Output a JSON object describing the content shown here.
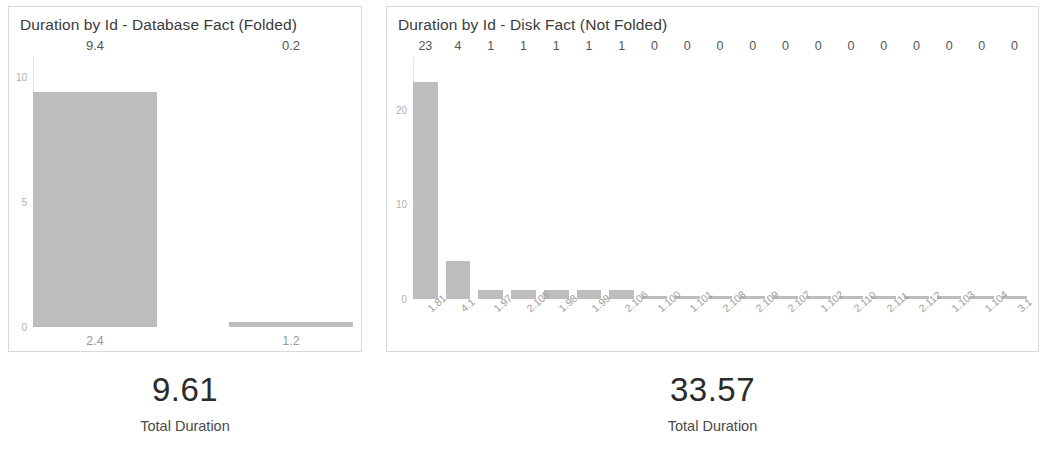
{
  "colors": {
    "bar": "#bdbdbd",
    "card_border": "#d9d9d9",
    "axis": "#e6e6e6",
    "tick_text": "#b0b0b0",
    "title_text": "#3b3b3b",
    "kpi_value_text": "#2b2b2b"
  },
  "left_panel": {
    "title": "Duration by Id - Database Fact (Folded)",
    "kpi": {
      "value": "9.61",
      "label": "Total Duration"
    }
  },
  "right_panel": {
    "title": "Duration by Id - Disk Fact (Not Folded)",
    "kpi": {
      "value": "33.57",
      "label": "Total Duration"
    }
  },
  "chart_data": [
    {
      "type": "bar",
      "title": "Duration by Id - Database Fact (Folded)",
      "xlabel": "",
      "ylabel": "",
      "categories": [
        "2.4",
        "1.2"
      ],
      "values": [
        9.4,
        0.2
      ],
      "value_labels": [
        "9.4",
        "0.2"
      ],
      "yticks": [
        0,
        5,
        10
      ],
      "ytick_labels": [
        "0",
        "5",
        "10"
      ],
      "ylim": [
        0,
        10.8
      ],
      "grid": false,
      "legend": false,
      "orientation": "vertical",
      "tick_label_rotation": 0
    },
    {
      "type": "bar",
      "title": "Duration by Id - Disk Fact (Not Folded)",
      "xlabel": "",
      "ylabel": "",
      "categories": [
        "1.81",
        "4.1",
        "1.97",
        "2.105",
        "1.98",
        "1.99",
        "2.106",
        "1.100",
        "1.101",
        "2.108",
        "2.109",
        "2.107",
        "1.102",
        "2.110",
        "2.111",
        "2.112",
        "1.103",
        "1.104",
        "3.1"
      ],
      "values": [
        23,
        4,
        1,
        1,
        1,
        1,
        1,
        0,
        0,
        0,
        0,
        0,
        0,
        0,
        0,
        0,
        0,
        0,
        0
      ],
      "value_labels": [
        "23",
        "4",
        "1",
        "1",
        "1",
        "1",
        "1",
        "0",
        "0",
        "0",
        "0",
        "0",
        "0",
        "0",
        "0",
        "0",
        "0",
        "0",
        "0"
      ],
      "yticks": [
        0,
        10,
        20
      ],
      "ytick_labels": [
        "0",
        "10",
        "20"
      ],
      "ylim": [
        0,
        25.6
      ],
      "grid": false,
      "legend": false,
      "orientation": "vertical",
      "tick_label_rotation": -40
    }
  ]
}
